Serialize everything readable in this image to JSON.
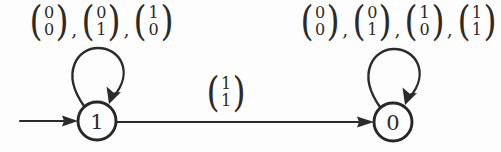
{
  "diagram": {
    "kind": "state-transition-diagram",
    "background_color": "#fdfdfd",
    "ink_color": "#2a2a2a",
    "states": [
      {
        "id": "state-1",
        "label": "1",
        "cx": 97,
        "cy": 121,
        "r": 19,
        "is_start": true
      },
      {
        "id": "state-0",
        "label": "0",
        "cx": 393,
        "cy": 122,
        "r": 19,
        "is_start": false
      }
    ],
    "start_arrow": {
      "from_x": 20,
      "to_x": 76,
      "y": 121
    },
    "self_loop_left": {
      "on_state": "state-1",
      "labels": [
        {
          "top": "0",
          "bottom": "0"
        },
        {
          "top": "0",
          "bottom": "1"
        },
        {
          "top": "1",
          "bottom": "0"
        }
      ],
      "separator": ","
    },
    "self_loop_right": {
      "on_state": "state-0",
      "labels": [
        {
          "top": "0",
          "bottom": "0"
        },
        {
          "top": "0",
          "bottom": "1"
        },
        {
          "top": "1",
          "bottom": "0"
        },
        {
          "top": "1",
          "bottom": "1"
        }
      ],
      "separator": ","
    },
    "transition_left_to_right": {
      "from": "state-1",
      "to": "state-0",
      "labels": [
        {
          "top": "1",
          "bottom": "1"
        }
      ]
    }
  }
}
